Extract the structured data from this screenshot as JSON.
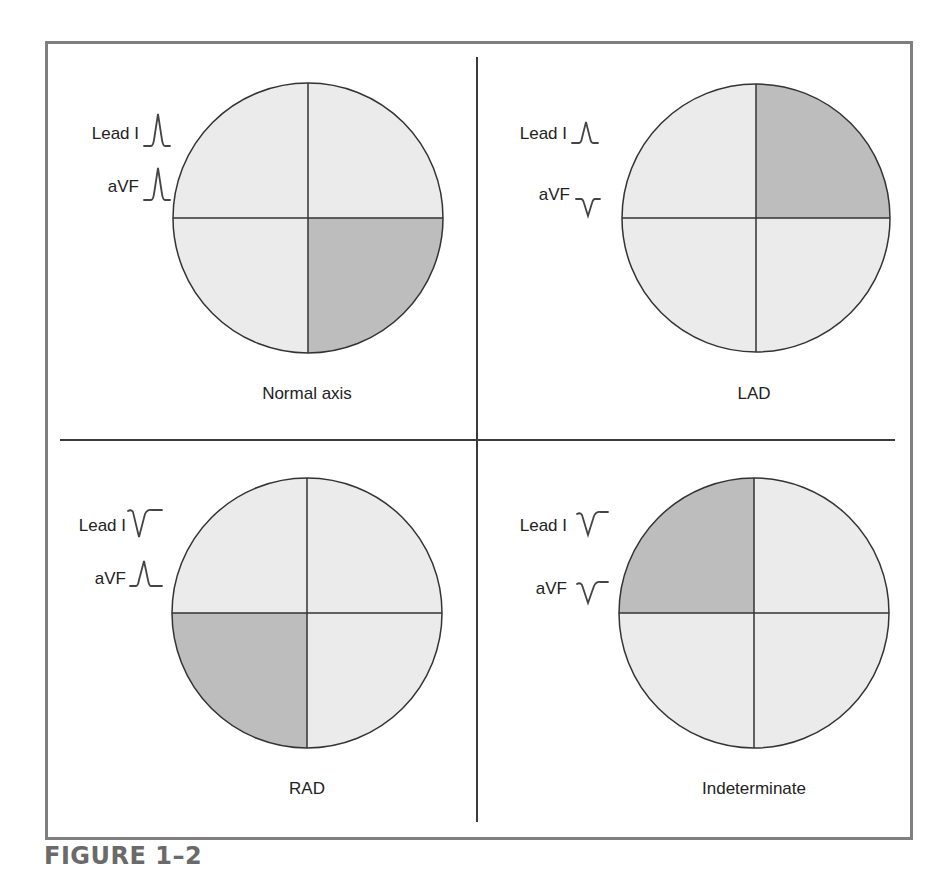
{
  "figure": {
    "caption": "FIGURE 1–2",
    "colors": {
      "frame": "#7f7f7f",
      "quadrant_light": "#ebebeb",
      "quadrant_shaded": "#bdbdbd",
      "outline": "#333333",
      "waveform": "#444444",
      "caption": "#6a6a6a"
    },
    "panels": [
      {
        "id": "normal-axis",
        "caption": "Normal axis",
        "shaded_quadrant": "bottom-right",
        "leads": [
          {
            "label": "Lead I",
            "deflection": "positive"
          },
          {
            "label": "aVF",
            "deflection": "positive"
          }
        ]
      },
      {
        "id": "lad",
        "caption": "LAD",
        "shaded_quadrant": "top-right",
        "leads": [
          {
            "label": "Lead I",
            "deflection": "positive"
          },
          {
            "label": "aVF",
            "deflection": "negative"
          }
        ]
      },
      {
        "id": "rad",
        "caption": "RAD",
        "shaded_quadrant": "bottom-left",
        "leads": [
          {
            "label": "Lead I",
            "deflection": "negative"
          },
          {
            "label": "aVF",
            "deflection": "positive"
          }
        ]
      },
      {
        "id": "indeterminate",
        "caption": "Indeterminate",
        "shaded_quadrant": "top-left",
        "leads": [
          {
            "label": "Lead I",
            "deflection": "negative"
          },
          {
            "label": "aVF",
            "deflection": "negative"
          }
        ]
      }
    ]
  }
}
